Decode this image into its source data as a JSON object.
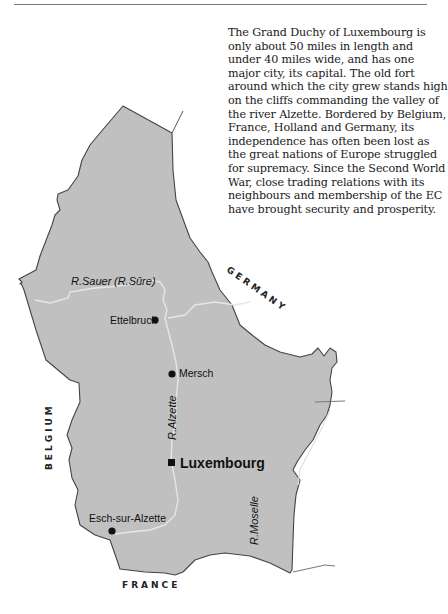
{
  "description": "The Grand Duchy of Luxembourg is only about 50 miles in length and under 40 miles wide, and has one major city, its capital. The old fort around which the city grew stands high on the cliffs commanding the valley of the river Alzette. Bordered by Belgium, France, Holland and Germany, its independence has often been lost as the great nations of Europe struggled for supremacy. Since the Second World War, close trading relations with its neighbours and membership of the EC have brought security and prosperity.",
  "map": {
    "colors": {
      "land": "#c0c0c0",
      "border": "#444444",
      "river": "#e6e6e6"
    },
    "countries": {
      "germany": "GERMANY",
      "belgium": "BELGIUM",
      "france": "FRANCE"
    },
    "rivers": {
      "sauer": "R.Sauer",
      "sure": "(R.Sûre)",
      "alzette": "R.Alzette",
      "moselle": "R.Moselle"
    },
    "towns": {
      "ettelbruck": "Ettelbruck",
      "mersch": "Mersch",
      "esch": "Esch-sur-Alzette"
    },
    "capital": "Luxembourg"
  }
}
